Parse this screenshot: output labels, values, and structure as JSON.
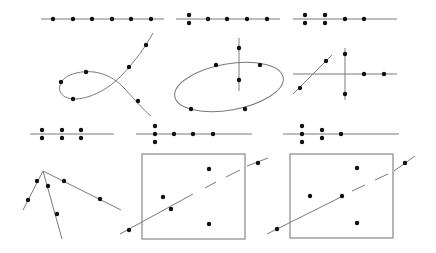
{
  "diagram": {
    "title": "",
    "colors": {
      "line": "#7a7a7a",
      "box": "#888888",
      "dot": "#111111",
      "background": "#ffffff"
    },
    "panels": [
      {
        "id": "r1c1",
        "kind": "line-with-points",
        "lines": [
          {
            "x1": 41,
            "y1": 19,
            "x2": 164,
            "y2": 19
          }
        ],
        "dots": [
          [
            53,
            19
          ],
          [
            73,
            19
          ],
          [
            92,
            19
          ],
          [
            112,
            19
          ],
          [
            131,
            19
          ],
          [
            151,
            19
          ]
        ]
      },
      {
        "id": "r1c2",
        "kind": "line-with-points",
        "lines": [
          {
            "x1": 176,
            "y1": 19,
            "x2": 280,
            "y2": 19
          }
        ],
        "dots": [
          [
            189,
            15
          ],
          [
            189,
            23
          ],
          [
            208,
            19
          ],
          [
            227,
            19
          ],
          [
            247,
            19
          ],
          [
            267,
            19
          ]
        ]
      },
      {
        "id": "r1c3",
        "kind": "line-with-points",
        "lines": [
          {
            "x1": 293,
            "y1": 19,
            "x2": 397,
            "y2": 19
          }
        ],
        "dots": [
          [
            305,
            15
          ],
          [
            305,
            23
          ],
          [
            325,
            15
          ],
          [
            325,
            23
          ],
          [
            345,
            19
          ],
          [
            364,
            19
          ]
        ]
      },
      {
        "id": "r2c1",
        "kind": "loop-curve",
        "path": "M153,33 C146,46 136,60 122,75 C104,94 80,102 68,98 C55,94 58,80 70,75 C88,68 108,72 122,86 C132,96 143,110 151,116",
        "dots": [
          [
            146,
            45
          ],
          [
            129,
            67
          ],
          [
            86,
            72
          ],
          [
            61,
            82
          ],
          [
            73,
            99
          ],
          [
            138,
            101
          ]
        ]
      },
      {
        "id": "r2c2",
        "kind": "ellipse-with-line",
        "ellipse": {
          "cx": 229,
          "cy": 87,
          "rx": 55,
          "ry": 23,
          "rotate": -10
        },
        "lines": [
          {
            "x1": 239,
            "y1": 38,
            "x2": 239,
            "y2": 91
          }
        ],
        "dots": [
          [
            239,
            48
          ],
          [
            239,
            80
          ],
          [
            216,
            65
          ],
          [
            260,
            65
          ],
          [
            191,
            109
          ],
          [
            245,
            109
          ]
        ]
      },
      {
        "id": "r2c3",
        "kind": "crossing-lines",
        "lines": [
          {
            "x1": 293,
            "y1": 74,
            "x2": 397,
            "y2": 74
          },
          {
            "x1": 345,
            "y1": 48,
            "x2": 345,
            "y2": 100
          },
          {
            "x1": 293,
            "y1": 94,
            "x2": 332,
            "y2": 55
          }
        ],
        "dots": [
          [
            300,
            88
          ],
          [
            326,
            61
          ],
          [
            345,
            54
          ],
          [
            345,
            94
          ],
          [
            364,
            74
          ],
          [
            384,
            74
          ]
        ]
      },
      {
        "id": "r3c1",
        "kind": "line-with-points",
        "lines": [
          {
            "x1": 30,
            "y1": 134,
            "x2": 114,
            "y2": 134
          }
        ],
        "dots": [
          [
            42,
            130
          ],
          [
            42,
            138
          ],
          [
            62,
            130
          ],
          [
            62,
            138
          ],
          [
            81,
            130
          ],
          [
            81,
            138
          ]
        ]
      },
      {
        "id": "r3c2",
        "kind": "line-with-points",
        "lines": [
          {
            "x1": 136,
            "y1": 134,
            "x2": 252,
            "y2": 134
          }
        ],
        "dots": [
          [
            155,
            126
          ],
          [
            155,
            134
          ],
          [
            155,
            142
          ],
          [
            174,
            134
          ],
          [
            193,
            134
          ],
          [
            213,
            134
          ]
        ]
      },
      {
        "id": "r3c3",
        "kind": "line-with-points",
        "lines": [
          {
            "x1": 283,
            "y1": 134,
            "x2": 399,
            "y2": 134
          }
        ],
        "dots": [
          [
            302,
            126
          ],
          [
            302,
            134
          ],
          [
            302,
            142
          ],
          [
            322,
            130
          ],
          [
            322,
            138
          ],
          [
            341,
            134
          ]
        ]
      },
      {
        "id": "r4c1",
        "kind": "fan-lines",
        "lines": [
          {
            "x1": 43,
            "y1": 171,
            "x2": 23,
            "y2": 210
          },
          {
            "x1": 43,
            "y1": 171,
            "x2": 62,
            "y2": 239
          },
          {
            "x1": 43,
            "y1": 171,
            "x2": 121,
            "y2": 210
          }
        ],
        "dots": [
          [
            37,
            181
          ],
          [
            28,
            200
          ],
          [
            48,
            186
          ],
          [
            57,
            214
          ],
          [
            64,
            181
          ],
          [
            100,
            199
          ]
        ]
      },
      {
        "id": "r4c2",
        "kind": "box-with-dashed-line",
        "box": {
          "x": 142,
          "y": 154,
          "w": 103,
          "h": 85
        },
        "lines": [
          {
            "x1": 120,
            "y1": 234,
            "x2": 193,
            "y2": 194
          },
          {
            "x1": 205,
            "y1": 188,
            "x2": 216,
            "y2": 182
          },
          {
            "x1": 226,
            "y1": 177,
            "x2": 240,
            "y2": 170
          },
          {
            "x1": 247,
            "y1": 166,
            "x2": 268,
            "y2": 158
          }
        ],
        "dots": [
          [
            129,
            230
          ],
          [
            171,
            209
          ],
          [
            163,
            197
          ],
          [
            209,
            169
          ],
          [
            209,
            224
          ],
          [
            258,
            163
          ]
        ]
      },
      {
        "id": "r4c3",
        "kind": "box-with-dashed-line",
        "box": {
          "x": 290,
          "y": 154,
          "w": 103,
          "h": 84
        },
        "lines": [
          {
            "x1": 267,
            "y1": 234,
            "x2": 343,
            "y2": 196
          },
          {
            "x1": 352,
            "y1": 191,
            "x2": 365,
            "y2": 185
          },
          {
            "x1": 375,
            "y1": 180,
            "x2": 388,
            "y2": 174
          },
          {
            "x1": 394,
            "y1": 171,
            "x2": 415,
            "y2": 156
          }
        ],
        "dots": [
          [
            277,
            229
          ],
          [
            342,
            196
          ],
          [
            310,
            196
          ],
          [
            357,
            168
          ],
          [
            357,
            223
          ],
          [
            405,
            163
          ]
        ]
      }
    ]
  }
}
